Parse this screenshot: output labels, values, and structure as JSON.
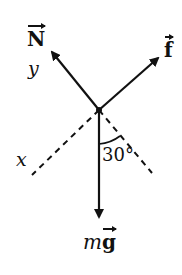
{
  "diagram": {
    "forces": [
      {
        "id": "normal",
        "label": "N",
        "vector": true
      },
      {
        "id": "friction",
        "label": "f",
        "vector": true
      },
      {
        "id": "weight",
        "label_prefix": "m",
        "label": "g",
        "vector": true
      }
    ],
    "axes": {
      "x_label": "x",
      "y_label": "y"
    },
    "angle": {
      "value": "30°"
    },
    "colors": {
      "stroke": "#111111",
      "background": "#ffffff"
    }
  }
}
